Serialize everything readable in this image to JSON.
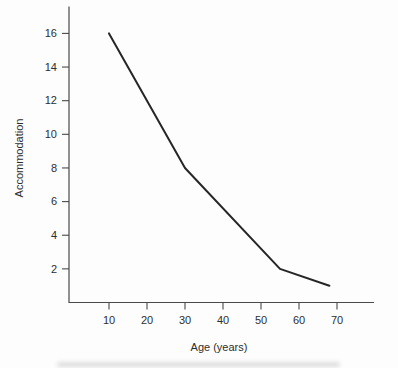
{
  "figure": {
    "background": "#fdfdfd",
    "axis_color": "#4a4a4a",
    "text_color": "#2e2e2e",
    "line_color": "#262626"
  },
  "chart_data": {
    "type": "line",
    "title": "",
    "xlabel": "Age (years)",
    "ylabel": "Accommodation",
    "series": [
      {
        "name": "accommodation-vs-age",
        "x": [
          10,
          30,
          55,
          68
        ],
        "y": [
          16,
          8,
          2,
          1
        ]
      }
    ],
    "x_ticks": [
      10,
      20,
      30,
      40,
      50,
      60,
      70
    ],
    "y_ticks": [
      2,
      4,
      6,
      8,
      10,
      12,
      14,
      16
    ],
    "xlim": [
      0,
      80
    ],
    "ylim": [
      0,
      17.6
    ],
    "grid": false,
    "legend": false
  }
}
